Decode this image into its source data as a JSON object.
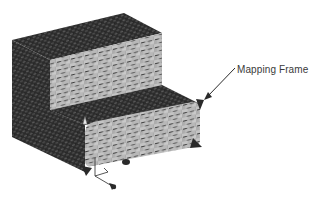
{
  "figure": {
    "annotations": [
      {
        "id": "mapping-frame",
        "text": "Mapping Frame"
      }
    ],
    "colors": {
      "dark_face": "#2e2e2e",
      "dark_face_texture": "#555555",
      "light_face": "#a9a9a9",
      "light_face_texture": "#cfcfcf",
      "mortar": "#4a4a4a",
      "arrow": "#2a2a2a",
      "background": "#ffffff"
    }
  }
}
